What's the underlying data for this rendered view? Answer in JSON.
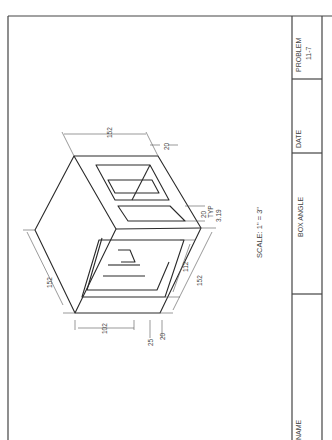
{
  "title_block": {
    "problem_label": "PROBLEM",
    "problem_number": "11-7",
    "date_label": "DATE",
    "drawing_title": "BOX ANGLE",
    "name_label": "NAME"
  },
  "drawing": {
    "scale_note": "SCALE:  1\"  =  3\"",
    "dimensions": {
      "top_width": "152",
      "left_height": "152",
      "right_depth": "152",
      "top_wall": "20",
      "typ_thickness": "20",
      "typ_note": "TYP",
      "slot_offset": "3.19",
      "inner_112": "112",
      "bottom_102": "102",
      "bottom_25": "25",
      "bottom_20": "20"
    }
  },
  "colors": {
    "line": "#2a2a2a",
    "dim": "#555555",
    "text": "#444444",
    "background": "#ffffff"
  }
}
